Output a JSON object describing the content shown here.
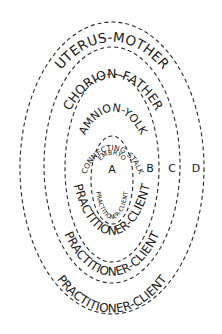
{
  "diagram": {
    "type": "nested-ellipses",
    "colors": {
      "stroke": "#2a2a2a",
      "text": "#1a1a1a",
      "background": "#ffffff"
    },
    "rings": [
      {
        "id": "D",
        "letter": "D",
        "top_label": "UTERUS-MOTHER",
        "bottom_label": "PRACTITIONER-CLIENT"
      },
      {
        "id": "C",
        "letter": "C",
        "top_label": "CHORION-FATHER",
        "bottom_label": "PRACTITIONER-CLIENT"
      },
      {
        "id": "B",
        "letter": "B",
        "top_label": "AMNION-YOLK",
        "bottom_label": "PRACTITIONER-CLIENT"
      },
      {
        "id": "A",
        "letter": "A",
        "top_label": "CONNECTING STALK",
        "inner_top_label": "EMBRYO",
        "bottom_label": "PRACTITIONER-CLIENT"
      }
    ]
  }
}
